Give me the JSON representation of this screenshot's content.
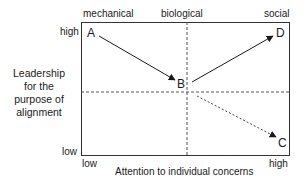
{
  "top_labels": {
    "left": "mechanical",
    "middle": "biological",
    "right": "social"
  },
  "y_axis": {
    "title_lines": [
      "Leadership",
      "for the",
      "purpose of",
      "alignment"
    ],
    "high": "high",
    "low": "low"
  },
  "x_axis": {
    "title": "Attention to individual concerns",
    "low": "low",
    "high": "high"
  },
  "points": {
    "A": "A",
    "B": "B",
    "C": "C",
    "D": "D"
  },
  "arrows": [
    {
      "from": "A",
      "to": "B",
      "style": "solid"
    },
    {
      "from": "B",
      "to": "D",
      "style": "solid"
    },
    {
      "from": "B",
      "to": "C",
      "style": "dashed"
    }
  ],
  "colors": {
    "line": "#1a1a1a",
    "dashed": "#555555"
  }
}
